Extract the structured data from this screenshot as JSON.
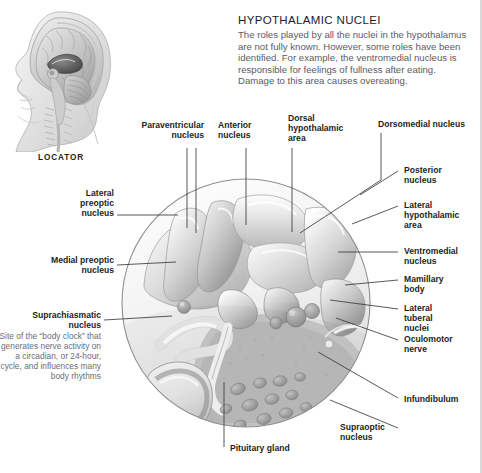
{
  "page": {
    "background": "#ffffff",
    "text_color": "#231f20",
    "caption_color": "#6d6d75",
    "leader_color": "#3a3a42"
  },
  "header": {
    "title": "HYPOTHALAMIC NUCLEI",
    "body": "The roles played by all the nuclei in the hypothalamus are not fully known. However, some roles have been identified. For example, the ventromedial nucleus is responsible for feelings of fullness after eating. Damage to this area causes overeating."
  },
  "locator": {
    "label": "LOCATOR",
    "alt": "sagittal head and brain locator illustration"
  },
  "figure": {
    "alt": "circular magnified view of the hypothalamus showing its nuclei"
  },
  "labels": {
    "top": [
      {
        "id": "paraventricular-nucleus",
        "text": "Paraventricular\nnucleus"
      },
      {
        "id": "anterior-nucleus",
        "text": "Anterior\nnucleus"
      },
      {
        "id": "dorsal-hypothalamic-area",
        "text": "Dorsal\nhypothalamic\narea"
      },
      {
        "id": "dorsomedial-nucleus",
        "text": "Dorsomedial nucleus"
      }
    ],
    "right": [
      {
        "id": "posterior-nucleus",
        "text": "Posterior\nnucleus"
      },
      {
        "id": "lateral-hypothalamic-area",
        "text": "Lateral\nhypothalamic\narea"
      },
      {
        "id": "ventromedial-nucleus",
        "text": "Ventromedial\nnucleus"
      },
      {
        "id": "mamillary-body",
        "text": "Mamillary\nbody"
      },
      {
        "id": "lateral-tuberal-nuclei",
        "text": "Lateral\ntuberal\nnuclei"
      },
      {
        "id": "oculomotor-nerve",
        "text": "Oculomotor\nnerve"
      },
      {
        "id": "infundibulum",
        "text": "Infundibulum"
      },
      {
        "id": "supraoptic-nucleus",
        "text": "Supraoptic\nnucleus"
      }
    ],
    "left": [
      {
        "id": "lateral-preoptic-nucleus",
        "text": "Lateral\npreoptic\nnucleus"
      },
      {
        "id": "medial-preoptic-nucleus",
        "text": "Medial preoptic\nnucleus"
      }
    ],
    "left_annotated": {
      "id": "suprachiasmatic-nucleus",
      "title": "Suprachiasmatic\nnucleus",
      "caption": "Site of the “body clock” that generates nerve activity on a circadian, or 24-hour, cycle, and influences many body rhythms"
    },
    "bottom": [
      {
        "id": "pituitary-gland",
        "text": "Pituitary gland"
      }
    ]
  }
}
